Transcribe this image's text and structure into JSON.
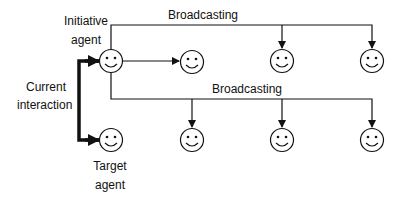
{
  "labels": {
    "initiative_agent_line1": "Initiative",
    "initiative_agent_line2": "agent",
    "broadcasting_top": "Broadcasting",
    "broadcasting_bottom": "Broadcasting",
    "current_interaction_line1": "Current",
    "current_interaction_line2": "interaction",
    "target_agent_line1": "Target",
    "target_agent_line2": "agent"
  },
  "nodes": [
    {
      "id": "initiative-agent",
      "icon": "smiley-face-icon",
      "x": 111,
      "y": 61
    },
    {
      "id": "row1-agent-1",
      "icon": "smiley-face-icon",
      "x": 192,
      "y": 62
    },
    {
      "id": "row1-agent-2",
      "icon": "smiley-face-icon",
      "x": 282,
      "y": 61
    },
    {
      "id": "row1-agent-3",
      "icon": "smiley-face-icon",
      "x": 372,
      "y": 61
    },
    {
      "id": "target-agent",
      "icon": "smiley-face-icon",
      "x": 111,
      "y": 140
    },
    {
      "id": "row2-agent-1",
      "icon": "smiley-face-icon",
      "x": 192,
      "y": 140
    },
    {
      "id": "row2-agent-2",
      "icon": "smiley-face-icon",
      "x": 282,
      "y": 140
    },
    {
      "id": "row2-agent-3",
      "icon": "smiley-face-icon",
      "x": 372,
      "y": 140
    }
  ],
  "colors": {
    "stroke": "#111111",
    "background": "#ffffff"
  }
}
